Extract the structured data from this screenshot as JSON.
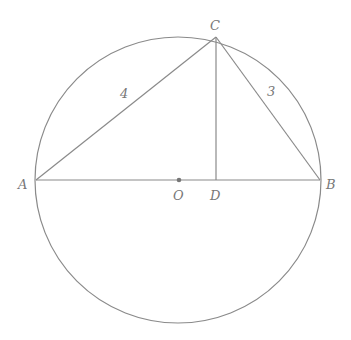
{
  "diagram": {
    "type": "geometry",
    "stroke_color": "#8a8a8a",
    "label_color": "#777777",
    "circle": {
      "center": "O",
      "cx": 178,
      "cy": 180,
      "r": 143
    },
    "points": {
      "A": {
        "label": "A",
        "x": 36,
        "y": 180
      },
      "B": {
        "label": "B",
        "x": 320,
        "y": 180
      },
      "C": {
        "label": "C",
        "x": 216,
        "y": 37
      },
      "D": {
        "label": "D",
        "x": 216,
        "y": 180
      },
      "O": {
        "label": "O",
        "x": 179,
        "y": 180
      }
    },
    "segments": [
      {
        "from": "A",
        "to": "B"
      },
      {
        "from": "A",
        "to": "C",
        "length_label": "4"
      },
      {
        "from": "C",
        "to": "B",
        "length_label": "3"
      },
      {
        "from": "C",
        "to": "D"
      }
    ],
    "labels": {
      "A": "A",
      "B": "B",
      "C": "C",
      "D": "D",
      "O": "O",
      "AC": "4",
      "CB": "3"
    }
  }
}
